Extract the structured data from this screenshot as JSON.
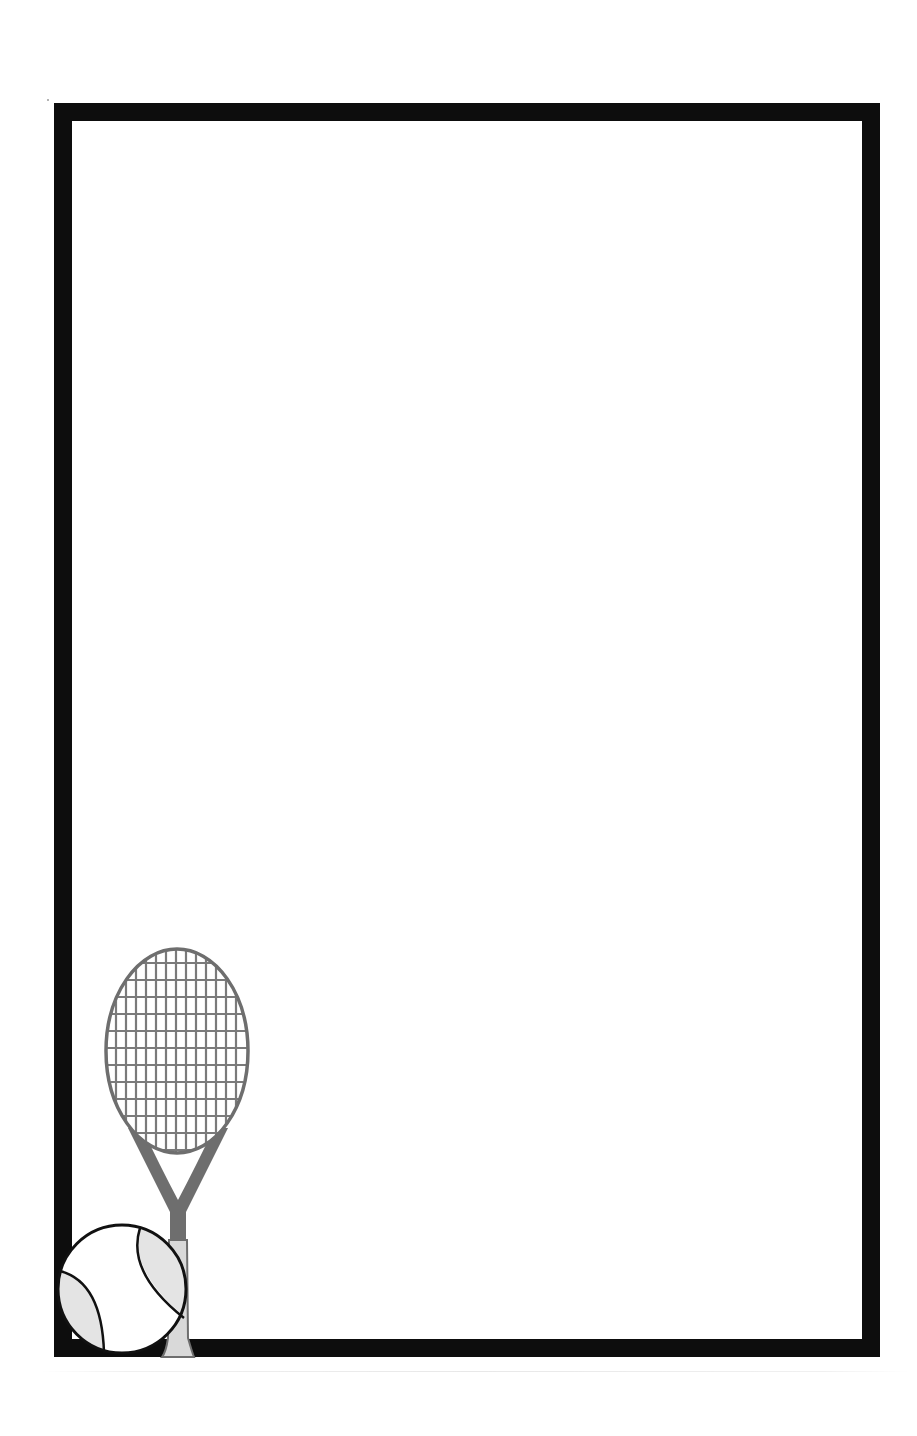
{
  "page": {
    "type": "printable stationery border",
    "theme": "tennis",
    "background_color": "#ffffff"
  },
  "frame": {
    "color": "#0d0d0d",
    "thickness_px": 18
  },
  "writing_area": {
    "content": ""
  },
  "decoration": {
    "racket": {
      "frame_color": "#6e6e6e",
      "string_color": "#7a7a7a",
      "handle_color": "#d9d9d9",
      "vertical_strings": 13,
      "horizontal_strings": 13
    },
    "ball": {
      "outline_color": "#111111",
      "fill_color": "#ffffff",
      "panel_color": "#e4e4e4"
    }
  },
  "icons": [
    "tennis-racket-icon",
    "tennis-ball-icon"
  ]
}
